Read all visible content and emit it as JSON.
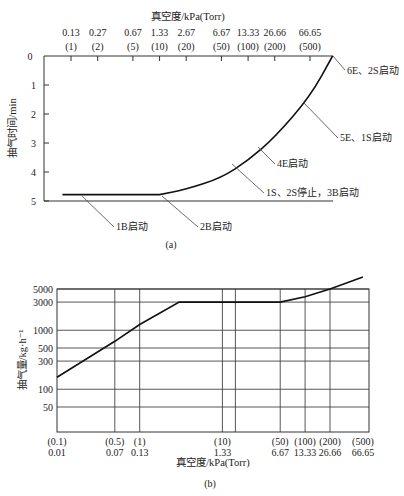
{
  "chart_data": [
    {
      "id": "a",
      "type": "line",
      "caption": "(a)",
      "title": "真空度/kPa(Torr)",
      "xlabel": "真空度/kPa(Torr)",
      "ylabel": "抽气时间/min",
      "x_axis_position": "top",
      "x_ticks": [
        {
          "kpa": "0.13",
          "torr": "(1)",
          "torr_value": 1
        },
        {
          "kpa": "0.27",
          "torr": "(2)",
          "torr_value": 2
        },
        {
          "kpa": "0.67",
          "torr": "(5)",
          "torr_value": 5
        },
        {
          "kpa": "1.33",
          "torr": "(10)",
          "torr_value": 10
        },
        {
          "kpa": "2.67",
          "torr": "(20)",
          "torr_value": 20
        },
        {
          "kpa": "6.67",
          "torr": "(50)",
          "torr_value": 50
        },
        {
          "kpa": "13.33",
          "torr": "(100)",
          "torr_value": 100
        },
        {
          "kpa": "26.66",
          "torr": "(200)",
          "torr_value": 200
        },
        {
          "kpa": "66.65",
          "torr": "(500)",
          "torr_value": 500
        }
      ],
      "y_ticks": [
        "0",
        "1",
        "2",
        "3",
        "4",
        "5"
      ],
      "ylim": [
        0,
        5
      ],
      "y_inverted": true,
      "series": [
        {
          "name": "pump-down curve",
          "points": [
            {
              "torr": 0.8,
              "min": 4.78
            },
            {
              "torr": 10,
              "min": 4.78
            },
            {
              "torr": 20,
              "min": 4.6
            },
            {
              "torr": 50,
              "min": 4.2
            },
            {
              "torr": 100,
              "min": 3.6
            },
            {
              "torr": 200,
              "min": 2.8
            },
            {
              "torr": 500,
              "min": 1.4
            },
            {
              "torr": 900,
              "min": 0.0
            }
          ]
        }
      ],
      "annotations": [
        {
          "label": "6E、2S启动",
          "torr": 900,
          "min": 0.0
        },
        {
          "label": "5E、1S启动",
          "torr": 330,
          "min": 2.1
        },
        {
          "label": "4E启动",
          "torr": 110,
          "min": 3.4
        },
        {
          "label": "1S、2S停止，3B启动",
          "torr": 55,
          "min": 4.0
        },
        {
          "label": "1B启动",
          "torr": 0.8,
          "min": 4.78
        },
        {
          "label": "2B启动",
          "torr": 10,
          "min": 4.78
        }
      ]
    },
    {
      "id": "b",
      "type": "line",
      "caption": "(b)",
      "xlabel": "真空度/kPa(Torr)",
      "ylabel": "抽气量/kg·h⁻¹",
      "y_scale": "log",
      "x_scale": "log",
      "x_ticks": [
        {
          "torr": "(0.1)",
          "kpa": "0.01",
          "torr_value": 0.1
        },
        {
          "torr": "(0.5)",
          "kpa": "0.07",
          "torr_value": 0.5
        },
        {
          "torr": "(1)",
          "kpa": "0.13",
          "torr_value": 1
        },
        {
          "torr": "(10)",
          "kpa": "1.33",
          "torr_value": 10
        },
        {
          "torr": "(50)",
          "kpa": "6.67",
          "torr_value": 50
        },
        {
          "torr": "(100)",
          "kpa": "13.33",
          "torr_value": 100
        },
        {
          "torr": "(200)",
          "kpa": "26.66",
          "torr_value": 200
        },
        {
          "torr": "(500)",
          "kpa": "66.65",
          "torr_value": 500
        }
      ],
      "y_ticks": [
        "5000",
        "3000",
        "1000",
        "500",
        "300",
        "100",
        "50"
      ],
      "ylim": [
        20,
        5000
      ],
      "grid": true,
      "series": [
        {
          "name": "pumping capacity",
          "points": [
            {
              "torr": 0.1,
              "kg_h": 160
            },
            {
              "torr": 0.5,
              "kg_h": 650
            },
            {
              "torr": 1,
              "kg_h": 1250
            },
            {
              "torr": 3,
              "kg_h": 3000
            },
            {
              "torr": 50,
              "kg_h": 3000
            },
            {
              "torr": 100,
              "kg_h": 3700
            },
            {
              "torr": 200,
              "kg_h": 5000
            },
            {
              "torr": 500,
              "kg_h": 8000
            }
          ]
        }
      ]
    }
  ]
}
